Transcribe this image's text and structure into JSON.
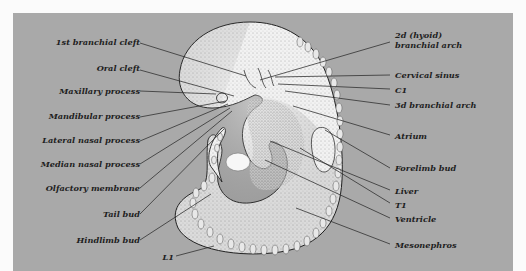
{
  "figure": {
    "background_color": "#a9a9a9",
    "labels_left": [
      {
        "id": "first-branchial-cleft",
        "text": "1st branchial cleft"
      },
      {
        "id": "oral-cleft",
        "text": "Oral cleft"
      },
      {
        "id": "maxillary-process",
        "text": "Maxillary process"
      },
      {
        "id": "mandibular-process",
        "text": "Mandibular process"
      },
      {
        "id": "lateral-nasal-process",
        "text": "Lateral nasal process"
      },
      {
        "id": "median-nasal-process",
        "text": "Median nasal process"
      },
      {
        "id": "olfactory-membrane",
        "text": "Olfactory membrane"
      },
      {
        "id": "tail-bud",
        "text": "Tail bud"
      },
      {
        "id": "hindlimb-bud",
        "text": "Hindlimb bud"
      },
      {
        "id": "l1",
        "text": "L1"
      }
    ],
    "labels_right": [
      {
        "id": "second-hyoid-branchial-arch",
        "line1": "2d (hyoid)",
        "line2": "branchial arch"
      },
      {
        "id": "cervical-sinus",
        "text": "Cervical sinus"
      },
      {
        "id": "c1",
        "text": "C1"
      },
      {
        "id": "third-branchial-arch",
        "text": "3d branchial arch"
      },
      {
        "id": "atrium",
        "text": "Atrium"
      },
      {
        "id": "forelimb-bud",
        "text": "Forelimb bud"
      },
      {
        "id": "liver",
        "text": "Liver"
      },
      {
        "id": "t1",
        "text": "T1"
      },
      {
        "id": "ventricle",
        "text": "Ventricle"
      },
      {
        "id": "mesonephros",
        "text": "Mesonephros"
      }
    ]
  }
}
